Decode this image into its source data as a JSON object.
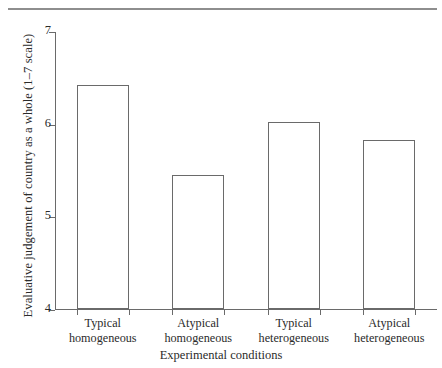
{
  "chart_data": {
    "type": "bar",
    "title": "",
    "subtitle": "",
    "xlabel": "Experimental conditions",
    "ylabel": "Evaluative judgement of country as a whole (1–7 scale)",
    "categories": [
      "Typical homogeneous",
      "Atypical homogeneous",
      "Typical heterogeneous",
      "Atypical heterogeneous"
    ],
    "category_lines": [
      [
        "Typical",
        "homogeneous"
      ],
      [
        "Atypical",
        "homogeneous"
      ],
      [
        "Typical",
        "heterogeneous"
      ],
      [
        "Atypical",
        "heterogeneous"
      ]
    ],
    "values": [
      6.42,
      5.45,
      6.02,
      5.82
    ],
    "ylim": [
      4,
      7
    ],
    "yticks": [
      4,
      5,
      6,
      7
    ],
    "ytick_labels": [
      "4",
      "5",
      "6",
      "7"
    ],
    "grid": false,
    "legend": false,
    "legend_position": "none",
    "bar_fill": "#ffffff",
    "bar_edge_color": "#6a6a6a",
    "axis_color": "#6a6a6a",
    "rule_color": "#8e8e8e"
  },
  "figure": {
    "top_rule": "horizontal-rule"
  }
}
